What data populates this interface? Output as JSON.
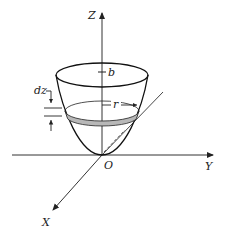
{
  "figure": {
    "type": "paraboloid-volume-element",
    "labels": {
      "z_axis": "Z",
      "y_axis": "Y",
      "x_axis": "X",
      "origin": "O",
      "height": "b",
      "radius": "r",
      "thickness": "dz"
    },
    "colors": {
      "line": "#111111",
      "axis": "#333333",
      "slice_fill": "#b8b8b8"
    }
  }
}
